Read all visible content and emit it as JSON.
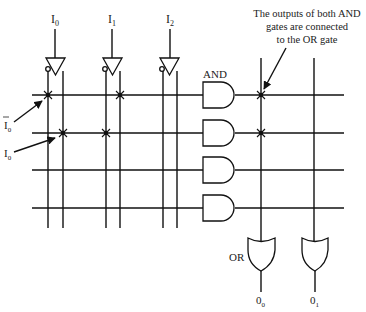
{
  "diagram": {
    "inputs": [
      {
        "name": "I",
        "sub": "0",
        "x": 55
      },
      {
        "name": "I",
        "sub": "1",
        "x": 112
      },
      {
        "name": "I",
        "sub": "2",
        "x": 170
      }
    ],
    "product_lines_y": [
      95,
      133,
      170,
      208
    ],
    "and_gate_label": "AND",
    "or_gate_label": "OR",
    "outputs": [
      {
        "name": "0",
        "sub": "0",
        "x": 261
      },
      {
        "name": "0",
        "sub": "1",
        "x": 314
      }
    ],
    "side_labels": [
      {
        "name": "I",
        "sub": "0",
        "overbar": true,
        "text": "Ī0"
      },
      {
        "name": "I",
        "sub": "0",
        "overbar": false,
        "text": "I0"
      }
    ],
    "annotation": {
      "lines": [
        "The outputs of both AND",
        "gates are connected",
        "to the OR gate"
      ]
    },
    "connections": {
      "and_plane": [
        {
          "row": 0,
          "line": "I0-bar"
        },
        {
          "row": 0,
          "line": "I1"
        },
        {
          "row": 1,
          "line": "I0"
        },
        {
          "row": 1,
          "line": "I1-bar"
        }
      ],
      "or_plane": [
        {
          "row": 0,
          "output": "O0"
        },
        {
          "row": 1,
          "output": "O0"
        }
      ]
    }
  }
}
